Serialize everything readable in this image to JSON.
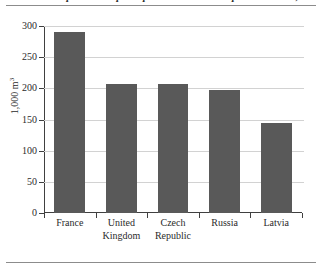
{
  "figure": {
    "caption": "Roundwood production per capita in selected European countries, 2012"
  },
  "chart_data": {
    "type": "bar",
    "title": "",
    "xlabel": "",
    "ylabel": "1,000 m",
    "ylabel_exponent": "3",
    "categories": [
      "France",
      "United Kingdom",
      "Czech Republic",
      "Russia",
      "Latvia"
    ],
    "category_lines": [
      [
        "France"
      ],
      [
        "United",
        "Kingdom"
      ],
      [
        "Czech",
        "Republic"
      ],
      [
        "Russia"
      ],
      [
        "Latvia"
      ]
    ],
    "values": [
      290,
      207,
      207,
      198,
      145
    ],
    "ylim": [
      0,
      300
    ],
    "yticks": [
      0,
      50,
      100,
      150,
      200,
      250,
      300
    ],
    "ytick_labels": [
      "0",
      "50",
      "100",
      "150",
      "200",
      "250",
      "300"
    ],
    "grid": true,
    "legend": false,
    "bar_color": "#595959",
    "axis_color": "#404040",
    "gridline_color": "#d2d2d2"
  }
}
